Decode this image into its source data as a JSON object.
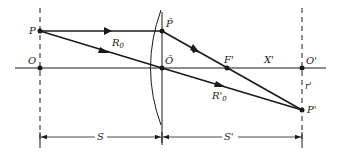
{
  "diagram": {
    "type": "thin-lens ray diagram",
    "labels": {
      "object_point": "P",
      "object_axis_point": "O",
      "lens_top_point": "P̃",
      "lens_center": "Õ",
      "focal_point": "F'",
      "image_distance_label": "X'",
      "image_axis_point": "O'",
      "image_height": "r'",
      "image_point": "P'",
      "chief_ray_object": "R",
      "chief_ray_object_sub": "0",
      "chief_ray_image": "R'",
      "chief_ray_image_sub": "0",
      "object_distance": "S",
      "image_distance": "S'"
    },
    "colors": {
      "line": "#1a1a1a",
      "background": "#ffffff"
    }
  }
}
